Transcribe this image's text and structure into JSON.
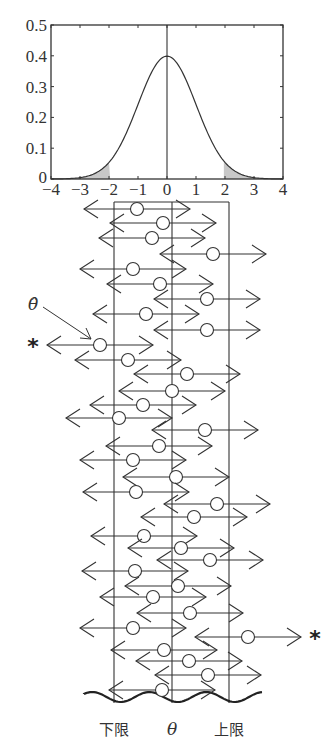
{
  "chart_data": {
    "type": "line",
    "title": "",
    "xlabel": "",
    "ylabel": "",
    "xlim": [
      -4,
      4
    ],
    "ylim": [
      0,
      0.5
    ],
    "x_ticks": [
      "−4",
      "−3",
      "−2",
      "−1",
      "0",
      "1",
      "2",
      "3",
      "4"
    ],
    "y_ticks": [
      "0",
      "0.1",
      "0.2",
      "0.3",
      "0.4",
      "0.5"
    ],
    "series": [
      {
        "name": "standard normal density",
        "mean": 0,
        "sd": 1,
        "peak": 0.4
      }
    ],
    "shaded_tails": [
      {
        "from": -4,
        "to": -1.96
      },
      {
        "from": 1.96,
        "to": 4
      }
    ],
    "grid": false,
    "legend": "none"
  },
  "plot": {
    "x0": 51,
    "x1": 283,
    "y0": 25,
    "y1": 179,
    "x_unit_px": 29,
    "center_x": 167,
    "y_max": 0.5,
    "tail_cut": 1.96
  },
  "interval_box": {
    "left": 114,
    "right": 229,
    "center": 172,
    "top": 202,
    "bottom": 703,
    "labels": {
      "lower": "下限",
      "center": "θ",
      "upper": "上限"
    }
  },
  "annotation": {
    "estimate_label": "θ̂",
    "star": "*"
  },
  "intervals": [
    {
      "y": 209,
      "c": 137,
      "star": false
    },
    {
      "y": 223,
      "c": 163,
      "star": false
    },
    {
      "y": 238,
      "c": 152,
      "star": false
    },
    {
      "y": 254,
      "c": 213,
      "star": false
    },
    {
      "y": 269,
      "c": 133,
      "star": false
    },
    {
      "y": 284,
      "c": 160,
      "star": false
    },
    {
      "y": 299,
      "c": 207,
      "star": false
    },
    {
      "y": 314,
      "c": 146,
      "star": false
    },
    {
      "y": 330,
      "c": 207,
      "star": false
    },
    {
      "y": 345,
      "c": 100,
      "star": true
    },
    {
      "y": 360,
      "c": 128,
      "star": false
    },
    {
      "y": 374,
      "c": 187,
      "star": false
    },
    {
      "y": 391,
      "c": 172,
      "star": false
    },
    {
      "y": 405,
      "c": 143,
      "star": false
    },
    {
      "y": 418,
      "c": 119,
      "star": false
    },
    {
      "y": 430,
      "c": 205,
      "star": false
    },
    {
      "y": 446,
      "c": 159,
      "star": false
    },
    {
      "y": 460,
      "c": 133,
      "star": false
    },
    {
      "y": 477,
      "c": 176,
      "star": false
    },
    {
      "y": 492,
      "c": 136,
      "star": false
    },
    {
      "y": 504,
      "c": 217,
      "star": false
    },
    {
      "y": 517,
      "c": 194,
      "star": false
    },
    {
      "y": 536,
      "c": 144,
      "star": false
    },
    {
      "y": 548,
      "c": 181,
      "star": false
    },
    {
      "y": 560,
      "c": 210,
      "star": false
    },
    {
      "y": 571,
      "c": 135,
      "star": false
    },
    {
      "y": 586,
      "c": 178,
      "star": false
    },
    {
      "y": 597,
      "c": 153,
      "star": false
    },
    {
      "y": 613,
      "c": 190,
      "star": false
    },
    {
      "y": 628,
      "c": 133,
      "star": false
    },
    {
      "y": 637,
      "c": 248,
      "star": true
    },
    {
      "y": 650,
      "c": 164,
      "star": false
    },
    {
      "y": 661,
      "c": 189,
      "star": false
    },
    {
      "y": 675,
      "c": 208,
      "star": false
    },
    {
      "y": 690,
      "c": 162,
      "star": false
    }
  ],
  "half_width": 53
}
